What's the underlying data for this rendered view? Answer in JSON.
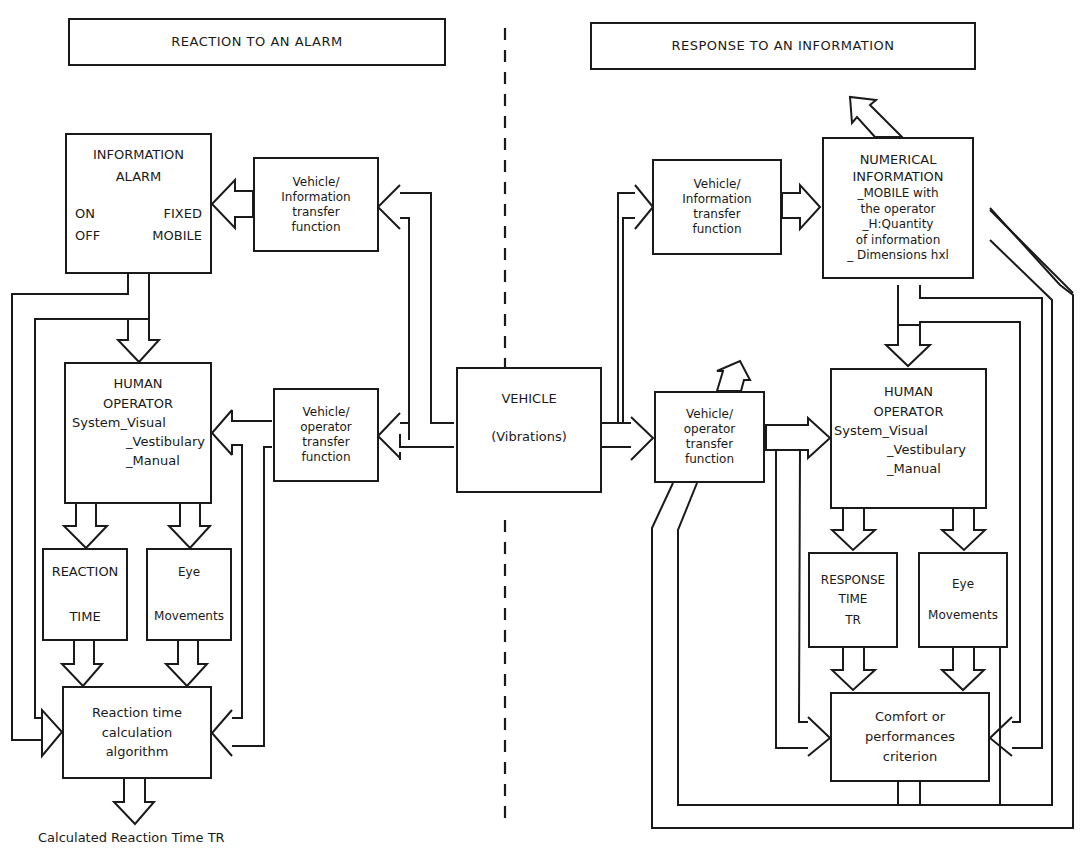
{
  "left_panel": {
    "title": "REACTION TO AN ALARM",
    "information_alarm": {
      "line1": "INFORMATION",
      "line2": "ALARM",
      "on": "ON",
      "fixed": "FIXED",
      "off": "OFF",
      "mobile": "MOBILE"
    },
    "vehicle_information_tf": {
      "line1": "Vehicle/",
      "line2": "Information",
      "line3": "transfer",
      "line4": "function"
    },
    "vehicle_operator_tf": {
      "line1": "Vehicle/",
      "line2": "operator",
      "line3": "transfer",
      "line4": "function"
    },
    "human_operator": {
      "line1": "HUMAN",
      "line2": "OPERATOR",
      "system": "System_Visual",
      "vestibulary": "_Vestibulary",
      "manual": "_Manual"
    },
    "reaction_time": {
      "line1": "REACTION",
      "line2": "TIME"
    },
    "eye_movements": {
      "line1": "Eye",
      "line2": "Movements"
    },
    "algorithm": {
      "line1": "Reaction time",
      "line2": "calculation",
      "line3": "algorithm"
    },
    "output_label": "Calculated Reaction Time TR"
  },
  "center": {
    "vehicle": {
      "line1": "VEHICLE",
      "line2": "(Vibrations)"
    }
  },
  "right_panel": {
    "title": "RESPONSE TO AN INFORMATION",
    "vehicle_information_tf": {
      "line1": "Vehicle/",
      "line2": "Information",
      "line3": "transfer",
      "line4": "function"
    },
    "numerical_information": {
      "line1": "NUMERICAL",
      "line2": "INFORMATION",
      "line3": "_MOBILE with",
      "line4": "the operator",
      "line5": "_H:Quantity",
      "line6": "of information",
      "line7": "_ Dimensions hxl"
    },
    "vehicle_operator_tf": {
      "line1": "Vehicle/",
      "line2": "operator",
      "line3": "transfer",
      "line4": "function"
    },
    "human_operator": {
      "line1": "HUMAN",
      "line2": "OPERATOR",
      "system": "System_Visual",
      "vestibulary": "_Vestibulary",
      "manual": "_Manual"
    },
    "response_time": {
      "line1": "RESPONSE",
      "line2": "TIME",
      "line3": "TR"
    },
    "eye_movements": {
      "line1": "Eye",
      "line2": "Movements"
    },
    "criterion": {
      "line1": "Comfort or",
      "line2": "performances",
      "line3": "criterion"
    }
  }
}
